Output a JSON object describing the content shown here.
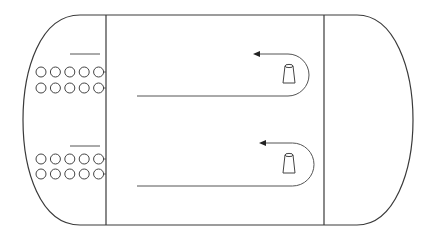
{
  "diagram": {
    "type": "top-down floor layout (rounded room with two rows of seats and two lanes with cone markers)",
    "colors": {
      "background": "#ffffff",
      "line": "#3a3a3a"
    },
    "outline": {
      "left_extent_x": 23,
      "right_extent_x": 413,
      "top_y": 15,
      "bottom_y": 225
    },
    "dividers": [
      {
        "name": "left-divider",
        "x": 106
      },
      {
        "name": "right-divider",
        "x": 324
      }
    ],
    "seat_groups": [
      {
        "name": "upper-seat-group",
        "bar": {
          "x1": 70,
          "x2": 100,
          "y": 54
        },
        "rows": [
          {
            "y": 72,
            "count": 5
          },
          {
            "y": 88,
            "count": 5
          }
        ]
      },
      {
        "name": "lower-seat-group",
        "bar": {
          "x1": 70,
          "x2": 100,
          "y": 146
        },
        "rows": [
          {
            "y": 159,
            "count": 5
          },
          {
            "y": 174,
            "count": 5
          }
        ]
      }
    ],
    "lanes": [
      {
        "name": "upper-lane",
        "line_start_x": 137,
        "line_y": 96,
        "arrow_tip_x": 253,
        "arrow_y": 54,
        "turn_right_x": 309,
        "cone": {
          "cx": 289,
          "top_y": 66,
          "base_y": 83
        }
      },
      {
        "name": "lower-lane",
        "line_start_x": 137,
        "line_y": 186,
        "arrow_tip_x": 259,
        "arrow_y": 143,
        "turn_right_x": 314,
        "cone": {
          "cx": 289,
          "top_y": 155,
          "base_y": 173
        }
      }
    ],
    "labels": []
  }
}
